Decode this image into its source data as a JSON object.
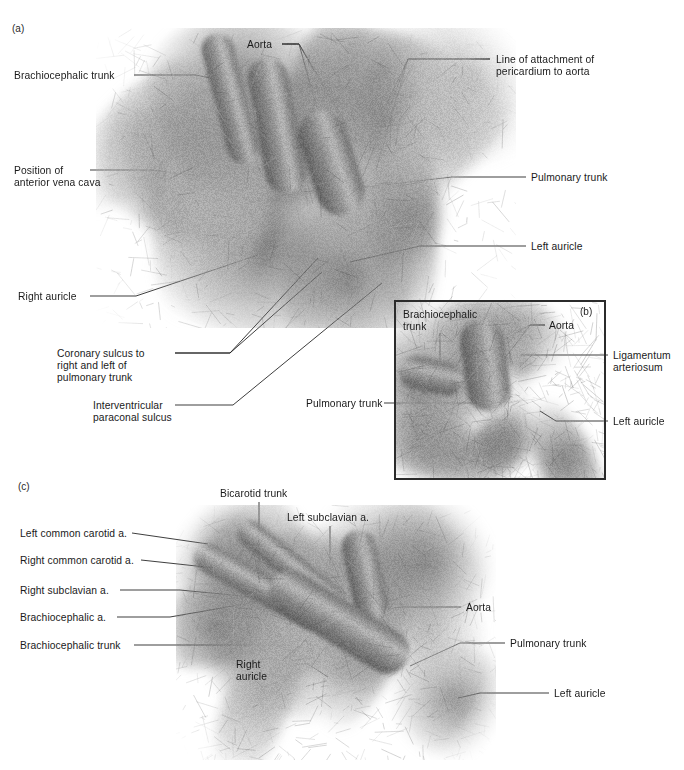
{
  "figure": {
    "background": "#ffffff",
    "line_color": "#1b1b1b",
    "text_color": "#1a1a1a"
  },
  "panels": [
    {
      "id": "panel-a",
      "tag": "(a)",
      "tag_pos": {
        "x": 12,
        "y": 23
      },
      "image": {
        "x": 96,
        "y": 28,
        "w": 420,
        "h": 300,
        "seed": 17,
        "tone": "grayscale-specimen"
      },
      "labels": [
        {
          "name": "label-brachiocephalic-trunk",
          "text": "Brachiocephalic trunk",
          "x": 14,
          "y": 70,
          "align": "left",
          "leads": [
            [
              [
                134,
                75
              ],
              [
                196,
                75
              ],
              [
                272,
                91
              ]
            ]
          ]
        },
        {
          "name": "label-aorta",
          "text": "Aorta",
          "x": 247,
          "y": 39,
          "align": "left",
          "leads": [
            [
              [
                282,
                44
              ],
              [
                299,
                44
              ],
              [
                332,
                162
              ]
            ],
            [
              [
                282,
                44
              ],
              [
                299,
                44
              ],
              [
                347,
                128
              ]
            ],
            [
              [
                282,
                44
              ],
              [
                299,
                44
              ],
              [
                358,
                143
              ]
            ]
          ]
        },
        {
          "name": "label-line-of-attachment",
          "text": "Line of attachment of\npericardium to aorta",
          "x": 496,
          "y": 54,
          "align": "left",
          "leads": [
            [
              [
                490,
                59
              ],
              [
                408,
                59
              ],
              [
                352,
                178
              ]
            ],
            [
              [
                490,
                59
              ],
              [
                408,
                59
              ],
              [
                363,
                176
              ]
            ],
            [
              [
                490,
                59
              ],
              [
                408,
                59
              ],
              [
                376,
                170
              ]
            ]
          ]
        },
        {
          "name": "label-position-of-anterior-vena-cava",
          "text": "Position of\nanterior vena cava",
          "x": 14,
          "y": 165,
          "align": "left",
          "leads": [
            [
              [
                90,
                170
              ],
              [
                152,
                170
              ],
              [
                262,
                183
              ]
            ]
          ]
        },
        {
          "name": "label-pulmonary-trunk-a",
          "text": "Pulmonary trunk",
          "x": 531,
          "y": 172,
          "align": "left",
          "leads": [
            [
              [
                526,
                177
              ],
              [
                452,
                177
              ],
              [
                333,
                191
              ]
            ]
          ]
        },
        {
          "name": "label-left-auricle-a",
          "text": "Left auricle",
          "x": 531,
          "y": 241,
          "align": "left",
          "leads": [
            [
              [
                526,
                246
              ],
              [
                420,
                246
              ],
              [
                350,
                262
              ]
            ]
          ]
        },
        {
          "name": "label-right-auricle-a",
          "text": "Right auricle",
          "x": 18,
          "y": 291,
          "align": "left",
          "leads": [
            [
              [
                90,
                296
              ],
              [
                136,
                296
              ],
              [
                258,
                255
              ]
            ]
          ]
        },
        {
          "name": "label-coronary-sulcus",
          "text": "Coronary sulcus to\nright and left of\npulmonary trunk",
          "x": 57,
          "y": 348,
          "align": "left",
          "leads": [
            [
              [
                175,
                353
              ],
              [
                230,
                353
              ],
              [
                318,
                258
              ]
            ],
            [
              [
                175,
                353
              ],
              [
                230,
                353
              ],
              [
                322,
                272
              ]
            ]
          ]
        },
        {
          "name": "label-interventricular-paraconal-sulcus",
          "text": "Interventricular\nparaconal sulcus",
          "x": 93,
          "y": 400,
          "align": "left",
          "leads": [
            [
              [
                175,
                405
              ],
              [
                233,
                405
              ],
              [
                382,
                283
              ]
            ]
          ]
        }
      ]
    },
    {
      "id": "panel-b",
      "tag": "(b)",
      "tag_pos": {
        "x": 580,
        "y": 306
      },
      "box": {
        "x": 396,
        "y": 302,
        "w": 208,
        "h": 176
      },
      "image": {
        "x": 396,
        "y": 302,
        "w": 208,
        "h": 176,
        "seed": 42,
        "tone": "grayscale-specimen"
      },
      "labels": [
        {
          "name": "label-brachiocephalic-trunk-b",
          "text": "Brachiocephalic\ntrunk",
          "x": 403,
          "y": 309,
          "align": "left",
          "leads": [
            [
              [
                440,
                333
              ],
              [
                440,
                369
              ]
            ]
          ]
        },
        {
          "name": "label-aorta-b",
          "text": "Aorta",
          "x": 549,
          "y": 320,
          "align": "left",
          "leads": [
            [
              [
                545,
                325
              ],
              [
                530,
                325
              ],
              [
                500,
                342
              ]
            ],
            [
              [
                545,
                325
              ],
              [
                530,
                325
              ],
              [
                490,
                378
              ]
            ]
          ]
        },
        {
          "name": "label-ligamentum-arteriosum",
          "text": "Ligamentum\narteriosum",
          "x": 613,
          "y": 350,
          "align": "left",
          "leads": [
            [
              [
                608,
                355
              ],
              [
                520,
                355
              ]
            ]
          ]
        },
        {
          "name": "label-left-auricle-b",
          "text": "Left auricle",
          "x": 613,
          "y": 416,
          "align": "left",
          "leads": [
            [
              [
                608,
                421
              ],
              [
                556,
                421
              ],
              [
                540,
                411
              ]
            ]
          ]
        },
        {
          "name": "label-pulmonary-trunk-b",
          "text": "Pulmonary trunk",
          "x": 306,
          "y": 398,
          "align": "left",
          "leads": [
            [
              [
                384,
                403
              ],
              [
                478,
                403
              ]
            ]
          ]
        }
      ]
    },
    {
      "id": "panel-c",
      "tag": "(c)",
      "tag_pos": {
        "x": 18,
        "y": 481
      },
      "image": {
        "x": 176,
        "y": 505,
        "w": 320,
        "h": 255,
        "seed": 91,
        "tone": "grayscale-specimen"
      },
      "labels": [
        {
          "name": "label-bicarotid-trunk",
          "text": "Bicarotid trunk",
          "x": 220,
          "y": 488,
          "align": "left",
          "leads": [
            [
              [
                259,
                502
              ],
              [
                259,
                585
              ]
            ]
          ]
        },
        {
          "name": "label-left-subclavian-a",
          "text": "Left subclavian a.",
          "x": 287,
          "y": 512,
          "align": "left",
          "leads": [
            [
              [
                330,
                526
              ],
              [
                330,
                578
              ]
            ]
          ]
        },
        {
          "name": "label-left-common-carotid-a",
          "text": "Left common carotid a.",
          "x": 20,
          "y": 528,
          "align": "left",
          "leads": [
            [
              [
                132,
                533
              ],
              [
                208,
                544
              ]
            ]
          ]
        },
        {
          "name": "label-right-common-carotid-a",
          "text": "Right common carotid a.",
          "x": 20,
          "y": 555,
          "align": "left",
          "leads": [
            [
              [
                141,
                560
              ],
              [
                215,
                568
              ]
            ]
          ]
        },
        {
          "name": "label-right-subclavian-a",
          "text": "Right subclavian a.",
          "x": 20,
          "y": 585,
          "align": "left",
          "leads": [
            [
              [
                120,
                590
              ],
              [
                180,
                590
              ],
              [
                242,
                596
              ]
            ]
          ]
        },
        {
          "name": "label-brachiocephalic-a",
          "text": "Brachiocephalic a.",
          "x": 20,
          "y": 612,
          "align": "left",
          "leads": [
            [
              [
                117,
                617
              ],
              [
                170,
                617
              ],
              [
                296,
                595
              ]
            ]
          ]
        },
        {
          "name": "label-brachiocephalic-trunk-c",
          "text": "Brachiocephalic trunk",
          "x": 20,
          "y": 640,
          "align": "left",
          "leads": [
            [
              [
                134,
                645
              ],
              [
                195,
                645
              ],
              [
                348,
                645
              ]
            ]
          ]
        },
        {
          "name": "label-right-auricle-c",
          "text": "Right\nauricle",
          "x": 236,
          "y": 659,
          "align": "left",
          "leads": [
            [
              [
                278,
                664
              ],
              [
                308,
                664
              ],
              [
                328,
                677
              ]
            ]
          ]
        },
        {
          "name": "label-aorta-c",
          "text": "Aorta",
          "x": 466,
          "y": 602,
          "align": "left",
          "leads": [
            [
              [
                461,
                607
              ],
              [
                400,
                607
              ],
              [
                388,
                609
              ]
            ]
          ]
        },
        {
          "name": "label-pulmonary-trunk-c",
          "text": "Pulmonary trunk",
          "x": 510,
          "y": 638,
          "align": "left",
          "leads": [
            [
              [
                505,
                643
              ],
              [
                460,
                643
              ],
              [
                410,
                666
              ]
            ]
          ]
        },
        {
          "name": "label-left-auricle-c",
          "text": "Left auricle",
          "x": 554,
          "y": 688,
          "align": "left",
          "leads": [
            [
              [
                549,
                693
              ],
              [
                480,
                693
              ],
              [
                458,
                698
              ]
            ]
          ]
        }
      ]
    }
  ]
}
